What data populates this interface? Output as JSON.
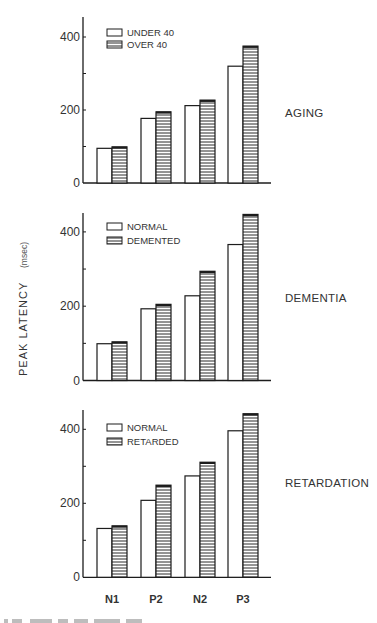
{
  "figure": {
    "ylabel": "PEAK  LATENCY",
    "ylabel_unit": "(msec)",
    "categories": [
      "N1",
      "P2",
      "N2",
      "P3"
    ]
  },
  "chart_data": [
    {
      "type": "bar",
      "title": "AGING",
      "xlabel": "",
      "ylabel": "PEAK LATENCY (msec)",
      "categories": [
        "N1",
        "P2",
        "N2",
        "P3"
      ],
      "series": [
        {
          "name": "UNDER 40",
          "pattern": "open",
          "values": [
            95,
            177,
            212,
            320
          ]
        },
        {
          "name": "OVER 40",
          "pattern": "horizontal-hatch",
          "values": [
            99,
            195,
            227,
            375
          ]
        }
      ],
      "ylim": [
        0,
        450
      ],
      "yticks": [
        0,
        100,
        200,
        300,
        400
      ],
      "ytick_labels": [
        "0",
        "",
        "200",
        "",
        "400"
      ],
      "legend_position": "upper-left",
      "grid": false
    },
    {
      "type": "bar",
      "title": "DEMENTIA",
      "xlabel": "",
      "ylabel": "PEAK LATENCY (msec)",
      "categories": [
        "N1",
        "P2",
        "N2",
        "P3"
      ],
      "series": [
        {
          "name": "NORMAL",
          "pattern": "open",
          "values": [
            99,
            193,
            228,
            366
          ]
        },
        {
          "name": "DEMENTED",
          "pattern": "horizontal-hatch",
          "values": [
            104,
            205,
            294,
            447
          ]
        }
      ],
      "ylim": [
        0,
        450
      ],
      "yticks": [
        0,
        100,
        200,
        300,
        400
      ],
      "ytick_labels": [
        "0",
        "",
        "200",
        "",
        "400"
      ],
      "legend_position": "upper-left",
      "grid": false
    },
    {
      "type": "bar",
      "title": "RETARDATION",
      "xlabel": "",
      "ylabel": "PEAK LATENCY (msec)",
      "categories": [
        "N1",
        "P2",
        "N2",
        "P3"
      ],
      "series": [
        {
          "name": "NORMAL",
          "pattern": "open",
          "values": [
            132,
            208,
            274,
            396
          ]
        },
        {
          "name": "RETARDED",
          "pattern": "horizontal-hatch",
          "values": [
            139,
            249,
            311,
            442
          ]
        }
      ],
      "ylim": [
        0,
        450
      ],
      "yticks": [
        0,
        100,
        200,
        300,
        400
      ],
      "ytick_labels": [
        "0",
        "",
        "200",
        "",
        "400"
      ],
      "legend_position": "upper-left",
      "grid": false
    }
  ],
  "layout": {
    "panels": [
      {
        "zero_y": 183,
        "px_per_unit": 0.365,
        "axis_top": 17,
        "legend_y": [
          32,
          44
        ],
        "label_y": 117
      },
      {
        "zero_y": 380.5,
        "px_per_unit": 0.3715,
        "axis_top": 213,
        "legend_y": [
          226,
          240
        ],
        "label_y": 302
      },
      {
        "zero_y": 577.3,
        "px_per_unit": 0.37,
        "axis_top": 410,
        "legend_y": [
          427,
          441
        ],
        "label_y": 487
      }
    ],
    "axis_x": 83,
    "axis_end_x": 271,
    "group_left_x": [
      97,
      141,
      185,
      228
    ],
    "bar_width": 15,
    "cat_label_y": 603
  },
  "colors": {
    "ink": "#1c1c1c",
    "hatch": "#2a2a2a",
    "background": "#ffffff"
  }
}
